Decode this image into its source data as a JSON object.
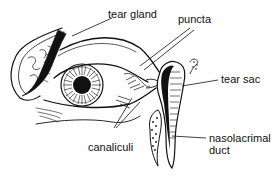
{
  "diagram": {
    "style": "black ink line illustration",
    "colors": {
      "ink": "#111111",
      "background": "#ffffff"
    },
    "labels": [
      {
        "id": "tear-gland",
        "text": "tear gland"
      },
      {
        "id": "puncta",
        "text": "puncta"
      },
      {
        "id": "tear-sac",
        "text": "tear sac"
      },
      {
        "id": "canaliculi",
        "text": "canaliculi"
      },
      {
        "id": "nasolacrimal-duct",
        "text": "nasolacrimal\nduct"
      }
    ]
  }
}
